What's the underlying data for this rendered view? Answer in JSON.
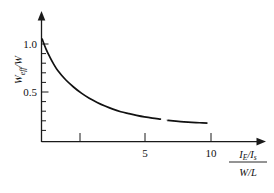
{
  "chart_data": {
    "type": "line",
    "title": "",
    "subtitle": "",
    "xlabel": "(I_E/I_s)/(W/L)",
    "ylabel": "W_eff/W",
    "xlim": [
      0,
      12.5
    ],
    "ylim": [
      0,
      1.18
    ],
    "grid": false,
    "legend": null,
    "x_ticks": [
      {
        "value": 2.5,
        "label": ""
      },
      {
        "value": 5,
        "label": "5"
      },
      {
        "value": 10,
        "label": "10"
      }
    ],
    "y_ticks": [
      {
        "value": 1.0,
        "label": "1.0"
      },
      {
        "value": 0.5,
        "label": "0.5"
      },
      {
        "value": 0.9,
        "label": ""
      },
      {
        "value": 0.8,
        "label": ""
      },
      {
        "value": 0.7,
        "label": ""
      },
      {
        "value": 0.6,
        "label": ""
      },
      {
        "value": 0.4,
        "label": ""
      },
      {
        "value": 0.3,
        "label": ""
      },
      {
        "value": 0.2,
        "label": ""
      },
      {
        "value": 0.1,
        "label": ""
      }
    ],
    "series": [
      {
        "name": "W_eff/W",
        "x": [
          0.0,
          0.25,
          0.5,
          0.75,
          1.0,
          1.5,
          2.0,
          2.5,
          3.0,
          3.5,
          4.0,
          4.5,
          5.0,
          5.5,
          6.0,
          6.5,
          7.0,
          7.5,
          8.0,
          8.5,
          9.0,
          9.5,
          10.0,
          10.5
        ],
        "y": [
          1.0,
          0.9,
          0.82,
          0.75,
          0.69,
          0.6,
          0.53,
          0.47,
          0.42,
          0.38,
          0.345,
          0.315,
          0.29,
          0.272,
          0.255,
          0.24,
          0.228,
          0.218,
          0.205,
          0.198,
          0.192,
          0.187,
          0.183,
          0.18
        ],
        "break_gap": {
          "x_start": 7.55,
          "x_end": 7.95
        }
      }
    ]
  },
  "axis_labels": {
    "y": {
      "symbol": "W",
      "sub": "eff",
      "denominator_symbol": "W",
      "full": "W_eff/W"
    },
    "x": {
      "numerator_left": "I",
      "numerator_left_sub": "E",
      "numerator_right": "I",
      "numerator_right_sub": "s",
      "denominator": "W/L",
      "full": "(I_E/I_s)/(W/L)"
    }
  },
  "colors": {
    "background": "#ffffff",
    "axis": "#1a1a1a",
    "curve": "#111111",
    "text": "#111111"
  }
}
